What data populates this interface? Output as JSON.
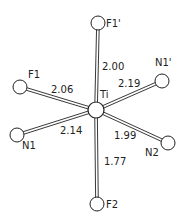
{
  "center": {
    "label": "Ti",
    "x": 96,
    "y": 110
  },
  "atoms": [
    {
      "label": "F1'",
      "x": 98,
      "y": 23,
      "lx": 106,
      "ly": 27
    },
    {
      "label": "F1",
      "x": 20,
      "y": 87,
      "lx": 28,
      "ly": 78
    },
    {
      "label": "N1'",
      "x": 162,
      "y": 81,
      "lx": 155,
      "ly": 66
    },
    {
      "label": "N1",
      "x": 17,
      "y": 135,
      "lx": 22,
      "ly": 149
    },
    {
      "label": "N2",
      "x": 168,
      "y": 143,
      "lx": 145,
      "ly": 156
    },
    {
      "label": "F2",
      "x": 97,
      "y": 204,
      "lx": 106,
      "ly": 208
    }
  ],
  "bonds": [
    {
      "to": "F1'",
      "length": "2.00",
      "lx": 102,
      "ly": 70
    },
    {
      "to": "F1",
      "length": "2.06",
      "lx": 51,
      "ly": 93
    },
    {
      "to": "N1'",
      "length": "2.19",
      "lx": 118,
      "ly": 87
    },
    {
      "to": "N1",
      "length": "2.14",
      "lx": 60,
      "ly": 134
    },
    {
      "to": "N2",
      "length": "1.99",
      "lx": 114,
      "ly": 139
    },
    {
      "to": "F2",
      "length": "1.77",
      "lx": 104,
      "ly": 165
    }
  ],
  "ti_label": {
    "text": "Ti",
    "x": 100,
    "y": 98
  }
}
